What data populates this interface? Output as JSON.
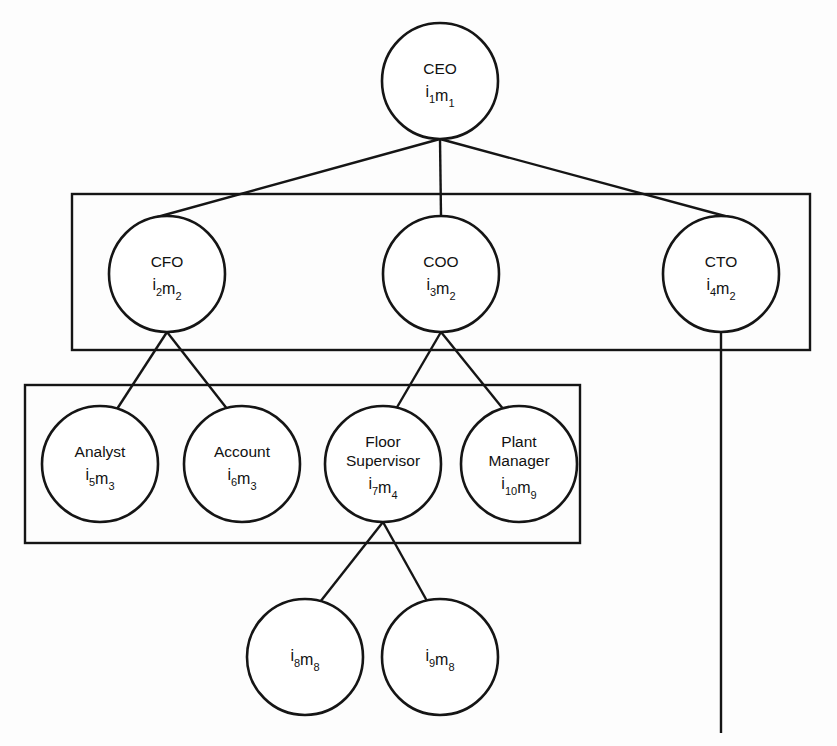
{
  "diagram": {
    "type": "organizational-hierarchy-tree",
    "title": "",
    "background_color": "#fdfdfd",
    "line_color": "#151515",
    "node_fill": "#ffffff",
    "nodes": [
      {
        "id": "ceo",
        "label": "CEO",
        "identifier_i": "i",
        "identifier_i_sub": "1",
        "identifier_m": "m",
        "identifier_m_sub": "1",
        "cx": 440,
        "cy": 81,
        "r": 58,
        "level": 1
      },
      {
        "id": "cfo",
        "label": "CFO",
        "identifier_i": "i",
        "identifier_i_sub": "2",
        "identifier_m": "m",
        "identifier_m_sub": "2",
        "cx": 167,
        "cy": 274,
        "r": 58,
        "level": 2
      },
      {
        "id": "coo",
        "label": "COO",
        "identifier_i": "i",
        "identifier_i_sub": "3",
        "identifier_m": "m",
        "identifier_m_sub": "2",
        "cx": 441,
        "cy": 274,
        "r": 58,
        "level": 2
      },
      {
        "id": "cto",
        "label": "CTO",
        "identifier_i": "i",
        "identifier_i_sub": "4",
        "identifier_m": "m",
        "identifier_m_sub": "2",
        "cx": 721,
        "cy": 274,
        "r": 58,
        "level": 2
      },
      {
        "id": "analyst",
        "label": "Analyst",
        "identifier_i": "i",
        "identifier_i_sub": "5",
        "identifier_m": "m",
        "identifier_m_sub": "3",
        "cx": 100,
        "cy": 464,
        "r": 58,
        "level": 3
      },
      {
        "id": "account",
        "label": "Account",
        "identifier_i": "i",
        "identifier_i_sub": "6",
        "identifier_m": "m",
        "identifier_m_sub": "3",
        "cx": 242,
        "cy": 464,
        "r": 58,
        "level": 3
      },
      {
        "id": "floor-supervisor",
        "label": "Floor Supervisor",
        "label_line1": "Floor",
        "label_line2": "Supervisor",
        "identifier_i": "i",
        "identifier_i_sub": "7",
        "identifier_m": "m",
        "identifier_m_sub": "4",
        "cx": 383,
        "cy": 464,
        "r": 58,
        "level": 3
      },
      {
        "id": "plant-manager",
        "label": "Plant Manager",
        "label_line1": "Plant",
        "label_line2": "Manager",
        "identifier_i": "i",
        "identifier_i_sub": "10",
        "identifier_m": "m",
        "identifier_m_sub": "9",
        "cx": 519,
        "cy": 464,
        "r": 58,
        "level": 3
      },
      {
        "id": "worker-8",
        "label": "",
        "identifier_i": "i",
        "identifier_i_sub": "8",
        "identifier_m": "m",
        "identifier_m_sub": "8",
        "cx": 305,
        "cy": 657,
        "r": 58,
        "level": 4
      },
      {
        "id": "worker-9",
        "label": "",
        "identifier_i": "i",
        "identifier_i_sub": "9",
        "identifier_m": "m",
        "identifier_m_sub": "8",
        "cx": 440,
        "cy": 657,
        "r": 58,
        "level": 4
      }
    ],
    "edges": [
      {
        "id": "ceo-cfo",
        "from": "ceo",
        "to": "cfo",
        "x1": 440,
        "y1": 139,
        "x2": 150,
        "y2": 219
      },
      {
        "id": "ceo-coo",
        "from": "ceo",
        "to": "coo",
        "x1": 440,
        "y1": 139,
        "x2": 441,
        "y2": 216
      },
      {
        "id": "ceo-cto",
        "from": "ceo",
        "to": "cto",
        "x1": 440,
        "y1": 139,
        "x2": 736,
        "y2": 219
      },
      {
        "id": "cfo-analyst",
        "from": "cfo",
        "to": "analyst",
        "x1": 167,
        "y1": 332,
        "x2": 117,
        "y2": 409
      },
      {
        "id": "cfo-account",
        "from": "cfo",
        "to": "account",
        "x1": 167,
        "y1": 332,
        "x2": 228,
        "y2": 410
      },
      {
        "id": "coo-floor-supervisor",
        "from": "coo",
        "to": "floor-supervisor",
        "x1": 441,
        "y1": 332,
        "x2": 396,
        "y2": 409
      },
      {
        "id": "coo-plant-manager",
        "from": "coo",
        "to": "plant-manager",
        "x1": 441,
        "y1": 332,
        "x2": 504,
        "y2": 410
      },
      {
        "id": "floor-supervisor-worker-8",
        "from": "floor-supervisor",
        "to": "worker-8",
        "x1": 383,
        "y1": 522,
        "x2": 320,
        "y2": 602
      },
      {
        "id": "floor-supervisor-worker-9",
        "from": "floor-supervisor",
        "to": "worker-9",
        "x1": 383,
        "y1": 522,
        "x2": 427,
        "y2": 601
      },
      {
        "id": "cto-dangling",
        "from": "cto",
        "to": null,
        "x1": 721,
        "y1": 332,
        "x2": 721,
        "y2": 733
      }
    ],
    "groups": [
      {
        "id": "executive-group",
        "x": 72,
        "y": 194,
        "width": 738,
        "height": 156
      },
      {
        "id": "operational-group",
        "x": 25,
        "y": 385,
        "width": 555,
        "height": 158
      }
    ]
  }
}
